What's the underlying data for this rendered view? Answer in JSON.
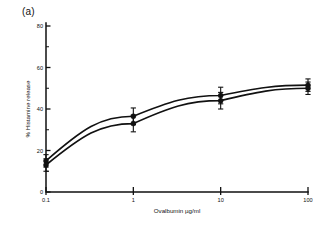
{
  "figure": {
    "panel_label": "(a)"
  },
  "chart_data": {
    "type": "line",
    "title": "",
    "xlabel": "Ovalbumin µg/ml",
    "ylabel": "% Histamine release",
    "xscale": "log",
    "xlim": [
      0.1,
      100
    ],
    "ylim": [
      0,
      80
    ],
    "x": [
      0.1,
      1,
      10,
      100
    ],
    "xtick_labels": [
      "0.1",
      "1",
      "10",
      "100"
    ],
    "ytick_labels": [
      "0",
      "20",
      "40",
      "60",
      "80"
    ],
    "ytick_values": [
      0,
      20,
      40,
      60,
      80
    ],
    "yminor_values": [
      10,
      30,
      50,
      70
    ],
    "grid": false,
    "legend": "none",
    "series": [
      {
        "name": "series-upper",
        "marker": "filled-circle",
        "values": [
          15.0,
          36.5,
          46.5,
          51.5
        ],
        "errors": [
          3.0,
          4.0,
          4.0,
          3.0
        ]
      },
      {
        "name": "series-lower",
        "marker": "filled-circle",
        "values": [
          13.0,
          33.0,
          44.0,
          50.0
        ],
        "errors": [
          3.0,
          4.0,
          4.0,
          3.0
        ]
      }
    ]
  }
}
